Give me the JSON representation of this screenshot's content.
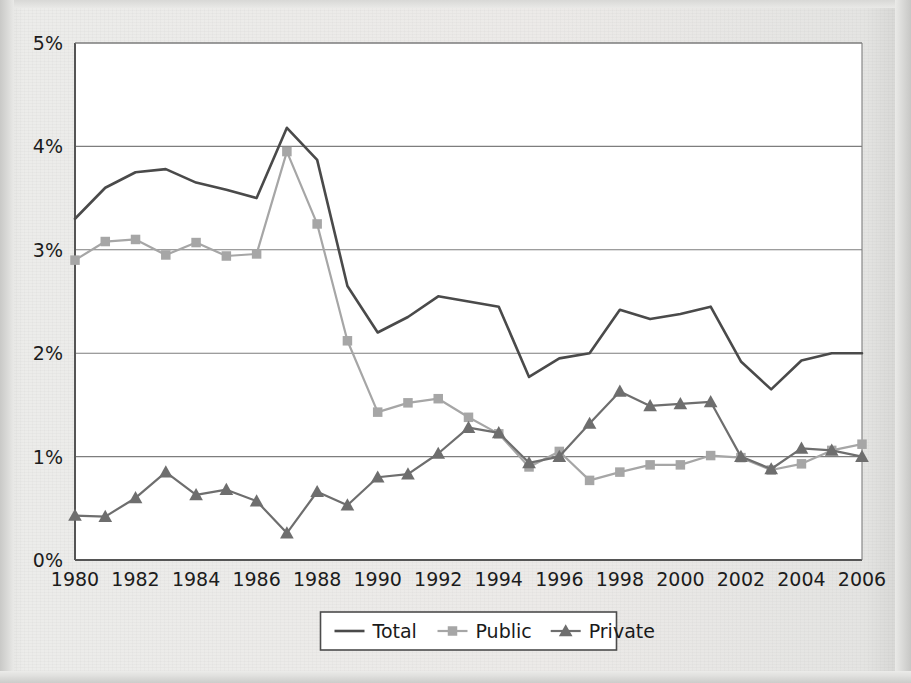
{
  "chart_data": {
    "type": "line",
    "title": "",
    "subtitle": "",
    "xlabel": "",
    "ylabel": "",
    "x": [
      1980,
      1981,
      1982,
      1983,
      1984,
      1985,
      1986,
      1987,
      1988,
      1989,
      1990,
      1991,
      1992,
      1993,
      1994,
      1995,
      1996,
      1997,
      1998,
      1999,
      2000,
      2001,
      2002,
      2003,
      2004,
      2005,
      2006
    ],
    "xtick_labels": [
      "1980",
      "1982",
      "1984",
      "1986",
      "1988",
      "1990",
      "1992",
      "1994",
      "1996",
      "1998",
      "2000",
      "2002",
      "2004",
      "2006"
    ],
    "xtick_values": [
      1980,
      1982,
      1984,
      1986,
      1988,
      1990,
      1992,
      1994,
      1996,
      1998,
      2000,
      2002,
      2004,
      2006
    ],
    "ytick_labels": [
      "0%",
      "1%",
      "2%",
      "3%",
      "4%",
      "5%"
    ],
    "ytick_values": [
      0,
      1,
      2,
      3,
      4,
      5
    ],
    "xlim": [
      1980,
      2006
    ],
    "ylim": [
      0,
      5
    ],
    "grid": "horizontal",
    "legend_position": "bottom",
    "series": [
      {
        "name": "Total",
        "color": "#4a4a4a",
        "marker": "none",
        "width": 2.6,
        "values": [
          3.3,
          3.6,
          3.75,
          3.78,
          3.65,
          3.58,
          3.5,
          4.18,
          3.87,
          2.65,
          2.2,
          2.35,
          2.55,
          2.5,
          2.45,
          1.77,
          1.95,
          2.0,
          2.42,
          2.33,
          2.38,
          2.45,
          1.92,
          1.65,
          1.93,
          2.0,
          2.0
        ]
      },
      {
        "name": "Public",
        "color": "#a6a6a6",
        "marker": "square",
        "width": 2.2,
        "values": [
          2.9,
          3.08,
          3.1,
          2.95,
          3.07,
          2.94,
          2.96,
          3.95,
          3.25,
          2.12,
          1.43,
          1.52,
          1.56,
          1.38,
          1.22,
          0.9,
          1.05,
          0.77,
          0.85,
          0.92,
          0.92,
          1.01,
          0.99,
          0.87,
          0.93,
          1.06,
          1.12
        ]
      },
      {
        "name": "Private",
        "color": "#6e6e6e",
        "marker": "triangle",
        "width": 2.2,
        "values": [
          0.43,
          0.42,
          0.6,
          0.85,
          0.63,
          0.68,
          0.57,
          0.26,
          0.66,
          0.53,
          0.8,
          0.83,
          1.03,
          1.28,
          1.23,
          0.94,
          1.0,
          1.32,
          1.63,
          1.49,
          1.51,
          1.53,
          1.0,
          0.88,
          1.08,
          1.06,
          1.0
        ]
      }
    ]
  },
  "legend": {
    "items": [
      {
        "label": "Total",
        "marker": "line",
        "color": "#4a4a4a"
      },
      {
        "label": "Public",
        "marker": "square",
        "color": "#a6a6a6"
      },
      {
        "label": "Private",
        "marker": "triangle",
        "color": "#6e6e6e"
      }
    ]
  },
  "colors": {
    "plot_background": "#ffffff",
    "page_background": "#eceae8",
    "axis": "#555555",
    "gridline": "#7d7d7d",
    "total": "#4a4a4a",
    "public": "#a6a6a6",
    "private": "#6e6e6e"
  },
  "geometry": {
    "plot_left": 75,
    "plot_right": 862,
    "plot_top": 43,
    "plot_bottom": 560
  }
}
